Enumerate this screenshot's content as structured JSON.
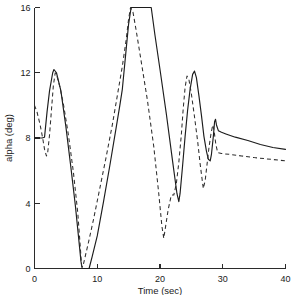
{
  "chart_data": {
    "type": "line",
    "title": "",
    "subtitle": "",
    "xlabel": "Time (sec)",
    "ylabel": "alpha (deg)",
    "xlim": [
      0,
      40
    ],
    "ylim": [
      0,
      16
    ],
    "xticks": [
      0,
      10,
      20,
      30,
      40
    ],
    "yticks": [
      0,
      4,
      8,
      12,
      16
    ],
    "xtick_labels": [
      "0",
      "10",
      "20",
      "30",
      "40"
    ],
    "ytick_labels": [
      "0",
      "4",
      "8",
      "12",
      "16"
    ],
    "grid": false,
    "legend": null,
    "legend_position": "none",
    "annotations": [],
    "series": [
      {
        "name": "solid",
        "style": "solid",
        "color": "#1c1c1c",
        "points": [
          [
            0.0,
            8.0
          ],
          [
            0.6,
            8.0
          ],
          [
            1.2,
            8.0
          ],
          [
            1.6,
            8.05
          ],
          [
            2.0,
            9.6
          ],
          [
            2.4,
            10.9
          ],
          [
            2.9,
            12.0
          ],
          [
            3.1,
            12.2
          ],
          [
            3.5,
            12.0
          ],
          [
            4.2,
            10.9
          ],
          [
            5.0,
            8.7
          ],
          [
            5.8,
            6.2
          ],
          [
            6.5,
            3.9
          ],
          [
            7.0,
            2.0
          ],
          [
            7.4,
            0.45
          ],
          [
            7.6,
            0.0
          ],
          [
            8.3,
            0.0
          ],
          [
            8.7,
            0.0
          ],
          [
            9.2,
            0.75
          ],
          [
            10.0,
            2.0
          ],
          [
            11.0,
            4.1
          ],
          [
            12.0,
            6.3
          ],
          [
            13.0,
            8.6
          ],
          [
            13.6,
            10.0
          ],
          [
            14.0,
            11.0
          ],
          [
            14.6,
            13.4
          ],
          [
            15.0,
            15.0
          ],
          [
            15.4,
            16.0
          ],
          [
            16.0,
            16.0
          ],
          [
            17.0,
            16.0
          ],
          [
            18.0,
            16.0
          ],
          [
            18.6,
            16.0
          ],
          [
            19.2,
            14.3
          ],
          [
            20.0,
            12.2
          ],
          [
            21.0,
            9.5
          ],
          [
            22.0,
            6.6
          ],
          [
            22.7,
            4.6
          ],
          [
            23.0,
            4.1
          ],
          [
            23.2,
            4.6
          ],
          [
            23.6,
            6.3
          ],
          [
            24.0,
            8.1
          ],
          [
            24.4,
            9.7
          ],
          [
            24.8,
            11.0
          ],
          [
            25.2,
            11.9
          ],
          [
            25.5,
            12.1
          ],
          [
            25.8,
            11.7
          ],
          [
            26.2,
            10.6
          ],
          [
            26.6,
            9.4
          ],
          [
            27.0,
            8.1
          ],
          [
            27.4,
            7.2
          ],
          [
            27.7,
            6.7
          ],
          [
            28.0,
            6.6
          ],
          [
            28.2,
            7.0
          ],
          [
            28.5,
            8.1
          ],
          [
            28.7,
            9.0
          ],
          [
            28.85,
            9.15
          ],
          [
            29.0,
            8.8
          ],
          [
            29.3,
            8.45
          ],
          [
            29.8,
            8.35
          ],
          [
            30.5,
            8.25
          ],
          [
            32.0,
            8.05
          ],
          [
            34.0,
            7.85
          ],
          [
            36.0,
            7.6
          ],
          [
            38.0,
            7.42
          ],
          [
            40.0,
            7.3
          ]
        ]
      },
      {
        "name": "dashed",
        "style": "dashed",
        "color": "#2e2e2e",
        "points": [
          [
            0.0,
            10.0
          ],
          [
            0.4,
            9.6
          ],
          [
            0.9,
            8.8
          ],
          [
            1.3,
            8.0
          ],
          [
            1.6,
            7.3
          ],
          [
            1.9,
            6.9
          ],
          [
            2.1,
            7.1
          ],
          [
            2.4,
            8.2
          ],
          [
            2.7,
            9.7
          ],
          [
            3.0,
            11.2
          ],
          [
            3.3,
            12.0
          ],
          [
            3.5,
            11.9
          ],
          [
            4.0,
            11.2
          ],
          [
            4.6,
            10.1
          ],
          [
            5.4,
            8.2
          ],
          [
            6.2,
            5.9
          ],
          [
            6.9,
            3.4
          ],
          [
            7.3,
            1.3
          ],
          [
            7.5,
            0.15
          ],
          [
            7.7,
            0.1
          ],
          [
            8.0,
            0.6
          ],
          [
            8.6,
            1.6
          ],
          [
            9.4,
            3.0
          ],
          [
            10.4,
            4.9
          ],
          [
            11.4,
            6.8
          ],
          [
            12.4,
            8.8
          ],
          [
            13.2,
            10.6
          ],
          [
            14.0,
            12.4
          ],
          [
            14.6,
            14.0
          ],
          [
            15.0,
            15.3
          ],
          [
            15.3,
            16.0
          ],
          [
            15.7,
            15.7
          ],
          [
            16.2,
            14.6
          ],
          [
            17.0,
            12.7
          ],
          [
            18.0,
            10.3
          ],
          [
            19.0,
            7.5
          ],
          [
            19.8,
            4.6
          ],
          [
            20.3,
            2.6
          ],
          [
            20.6,
            1.85
          ],
          [
            20.9,
            2.6
          ],
          [
            21.3,
            3.6
          ],
          [
            21.8,
            4.5
          ],
          [
            22.2,
            4.5
          ],
          [
            22.6,
            5.2
          ],
          [
            23.0,
            6.5
          ],
          [
            23.4,
            8.2
          ],
          [
            23.7,
            9.8
          ],
          [
            24.0,
            11.1
          ],
          [
            24.3,
            11.8
          ],
          [
            24.6,
            11.6
          ],
          [
            25.0,
            10.7
          ],
          [
            25.5,
            9.3
          ],
          [
            26.0,
            7.8
          ],
          [
            26.4,
            6.4
          ],
          [
            26.7,
            5.5
          ],
          [
            26.9,
            4.9
          ],
          [
            27.2,
            5.4
          ],
          [
            27.5,
            6.4
          ],
          [
            27.8,
            7.4
          ],
          [
            28.1,
            8.2
          ],
          [
            28.4,
            8.8
          ],
          [
            28.6,
            8.5
          ],
          [
            28.9,
            7.6
          ],
          [
            29.2,
            7.1
          ],
          [
            29.8,
            7.05
          ],
          [
            31.0,
            7.0
          ],
          [
            33.0,
            6.9
          ],
          [
            35.0,
            6.8
          ],
          [
            37.0,
            6.72
          ],
          [
            40.0,
            6.6
          ]
        ]
      }
    ]
  },
  "axes": {
    "x_axis_name": "Time (sec)",
    "y_axis_name": "alpha (deg)"
  }
}
